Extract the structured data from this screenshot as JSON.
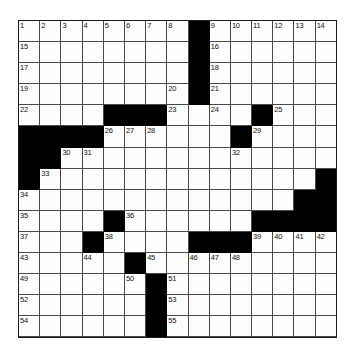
{
  "puzzle": {
    "type": "crossword-grid",
    "title": "Crossword Puzzle Grid",
    "columns": 15,
    "rows": 15,
    "background_color": "#ffffff",
    "cell_fill_color": "#fdfdfd",
    "block_color": "#000000",
    "grid_line_color": "#4a4a4a",
    "border_color": "#1d1d1d",
    "number_color": "#111111",
    "max_clue_number": 55,
    "cells": [
      [
        {
          "n": "1"
        },
        {
          "n": "2"
        },
        {
          "n": "3"
        },
        {
          "n": "4"
        },
        {
          "n": "5"
        },
        {
          "n": "6"
        },
        {
          "n": "7"
        },
        {
          "n": "8"
        },
        {
          "b": true
        },
        {
          "n": "9"
        },
        {
          "n": "10"
        },
        {
          "n": "11"
        },
        {
          "n": "12"
        },
        {
          "n": "13"
        },
        {
          "n": "14"
        }
      ],
      [
        {
          "n": "15"
        },
        {},
        {},
        {},
        {},
        {},
        {},
        {},
        {
          "b": true
        },
        {
          "n": "16"
        },
        {},
        {},
        {},
        {},
        {}
      ],
      [
        {
          "n": "17"
        },
        {},
        {},
        {},
        {},
        {},
        {},
        {},
        {
          "b": true
        },
        {
          "n": "18"
        },
        {},
        {},
        {},
        {},
        {}
      ],
      [
        {
          "n": "19"
        },
        {},
        {},
        {},
        {},
        {},
        {},
        {
          "n": "20"
        },
        {
          "b": true
        },
        {
          "n": "21"
        },
        {},
        {},
        {},
        {},
        {}
      ],
      [
        {
          "n": "22"
        },
        {},
        {},
        {},
        {
          "b": true
        },
        {
          "b": true
        },
        {
          "b": true
        },
        {
          "n": "23"
        },
        {},
        {
          "n": "24"
        },
        {},
        {
          "b": true
        },
        {
          "n": "25"
        },
        {},
        {}
      ],
      [
        {
          "b": true
        },
        {
          "b": true
        },
        {
          "b": true
        },
        {
          "b": true
        },
        {
          "n": "26"
        },
        {
          "n": "27"
        },
        {
          "n": "28"
        },
        {},
        {},
        {},
        {
          "b": true
        },
        {
          "n": "29"
        },
        {},
        {},
        {}
      ],
      [
        {
          "b": true
        },
        {
          "b": true
        },
        {
          "n": "30"
        },
        {
          "n": "31"
        },
        {},
        {},
        {},
        {},
        {},
        {},
        {
          "n": "32"
        },
        {},
        {},
        {},
        {}
      ],
      [
        {
          "b": true
        },
        {
          "n": "33"
        },
        {},
        {},
        {},
        {},
        {},
        {},
        {},
        {},
        {},
        {},
        {},
        {},
        {
          "b": true
        }
      ],
      [
        {
          "n": "34"
        },
        {},
        {},
        {},
        {},
        {},
        {},
        {},
        {},
        {},
        {},
        {},
        {},
        {
          "b": true
        },
        {
          "b": true
        }
      ],
      [
        {
          "n": "35"
        },
        {},
        {},
        {},
        {
          "b": true
        },
        {
          "n": "36"
        },
        {},
        {},
        {},
        {},
        {},
        {
          "b": true
        },
        {
          "b": true
        },
        {
          "b": true
        },
        {
          "b": true
        }
      ],
      [
        {
          "n": "37"
        },
        {},
        {},
        {
          "b": true
        },
        {
          "n": "38"
        },
        {},
        {},
        {},
        {
          "b": true
        },
        {
          "b": true
        },
        {
          "b": true
        },
        {
          "n": "39"
        },
        {
          "n": "40"
        },
        {
          "n": "41"
        },
        {
          "n": "42"
        }
      ],
      [
        {
          "n": "43"
        },
        {},
        {},
        {
          "n": "44"
        },
        {},
        {
          "b": true
        },
        {
          "n": "45"
        },
        {},
        {
          "n": "46"
        },
        {
          "n": "47"
        },
        {
          "n": "48"
        },
        {},
        {},
        {},
        {}
      ],
      [
        {
          "n": "49"
        },
        {},
        {},
        {},
        {},
        {
          "n": "50"
        },
        {
          "b": true
        },
        {
          "n": "51"
        },
        {},
        {},
        {},
        {},
        {},
        {},
        {}
      ],
      [
        {
          "n": "52"
        },
        {},
        {},
        {},
        {},
        {},
        {
          "b": true
        },
        {
          "n": "53"
        },
        {},
        {},
        {},
        {},
        {},
        {},
        {}
      ],
      [
        {
          "n": "54"
        },
        {},
        {},
        {},
        {},
        {},
        {
          "b": true
        },
        {
          "n": "55"
        },
        {},
        {},
        {},
        {},
        {},
        {},
        {}
      ]
    ]
  }
}
